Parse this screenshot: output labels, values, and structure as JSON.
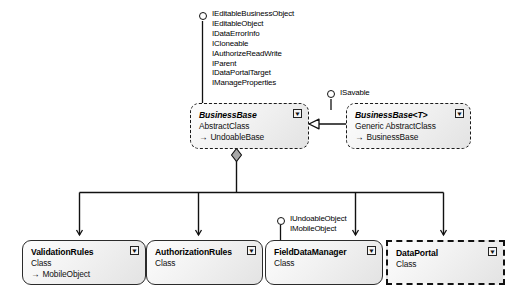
{
  "diagram": {
    "type": "uml-class-diagram",
    "background": "#ffffff",
    "line_color": "#111111",
    "box_fill": "#efefef"
  },
  "interface_groups": [
    {
      "id": "businessbase-interfaces",
      "lollipop": true,
      "items": [
        "IEditableBusinessObject",
        "IEditableObject",
        "IDataErrorInfo",
        "ICloneable",
        "IAuthorizeReadWrite",
        "IParent",
        "IDataPortalTarget",
        "IManageProperties"
      ]
    },
    {
      "id": "savable-interfaces",
      "lollipop": true,
      "items": [
        "ISavable"
      ]
    },
    {
      "id": "fielddatamanager-interfaces",
      "lollipop": true,
      "items": [
        "IUndoableObject",
        "IMobileObject"
      ]
    }
  ],
  "classes": [
    {
      "id": "business-base",
      "name": "BusinessBase",
      "stereotype": "AbstractClass",
      "base": "UndoableBase",
      "italic": true,
      "border": "dashed",
      "collapse_icon": "collapse-icon"
    },
    {
      "id": "business-base-generic",
      "name": "BusinessBase<T>",
      "stereotype": "Generic AbstractClass",
      "base": "BusinessBase",
      "italic": true,
      "border": "dashed",
      "collapse_icon": "collapse-icon"
    },
    {
      "id": "validation-rules",
      "name": "ValidationRules",
      "stereotype": "Class",
      "base": "MobileObject",
      "italic": false,
      "border": "solid",
      "collapse_icon": "collapse-icon"
    },
    {
      "id": "authorization-rules",
      "name": "AuthorizationRules",
      "stereotype": "Class",
      "base": "",
      "italic": false,
      "border": "solid",
      "collapse_icon": "collapse-icon"
    },
    {
      "id": "field-data-manager",
      "name": "FieldDataManager",
      "stereotype": "Class",
      "base": "",
      "italic": false,
      "border": "solid",
      "collapse_icon": "collapse-icon"
    },
    {
      "id": "data-portal",
      "name": "DataPortal",
      "stereotype": "Class",
      "base": "",
      "italic": false,
      "border": "dashed-square",
      "collapse_icon": "collapse-icon"
    }
  ],
  "relationships": [
    {
      "id": "generic-inherits-businessbase",
      "kind": "inheritance",
      "from": "business-base-generic",
      "to": "business-base",
      "marker": "hollow-triangle"
    },
    {
      "id": "businessbase-aggregates",
      "kind": "aggregation",
      "from": "business-base",
      "marker": "filled-diamond",
      "to": [
        "validation-rules",
        "authorization-rules",
        "field-data-manager",
        "data-portal"
      ]
    }
  ]
}
